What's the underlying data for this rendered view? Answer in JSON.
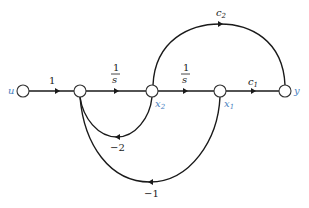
{
  "diagram": {
    "type": "signal-flow-graph",
    "nodes": [
      {
        "id": "u",
        "label": "u"
      },
      {
        "id": "n1",
        "label": ""
      },
      {
        "id": "x2",
        "label": "x",
        "sub": "2"
      },
      {
        "id": "x1",
        "label": "x",
        "sub": "1"
      },
      {
        "id": "y",
        "label": "y"
      }
    ],
    "edges": [
      {
        "from": "u",
        "to": "n1",
        "gain": "1"
      },
      {
        "from": "n1",
        "to": "x2",
        "gain_num": "1",
        "gain_den": "s"
      },
      {
        "from": "x2",
        "to": "x1",
        "gain_num": "1",
        "gain_den": "s"
      },
      {
        "from": "x1",
        "to": "y",
        "gain": "c",
        "gain_sub": "1"
      },
      {
        "from": "x2",
        "to": "y",
        "gain": "c",
        "gain_sub": "2"
      },
      {
        "from": "x2",
        "to": "n1",
        "gain": "−2"
      },
      {
        "from": "x1",
        "to": "n1",
        "gain": "−1"
      }
    ]
  }
}
